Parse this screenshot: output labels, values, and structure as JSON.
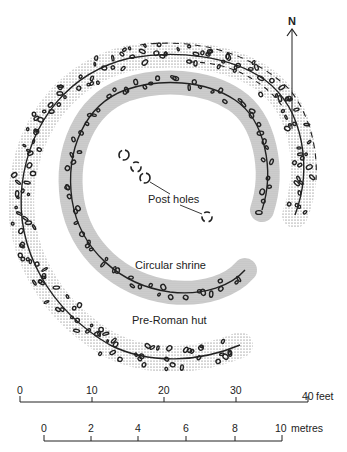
{
  "diagram": {
    "type": "archaeological site plan",
    "north_label": "N",
    "labels": {
      "post_holes": "Post holes",
      "circular_shrine": "Circular shrine",
      "pre_roman_hut": "Pre-Roman hut"
    },
    "scale_feet": {
      "ticks": [
        "0",
        "10",
        "20",
        "30",
        "40"
      ],
      "unit": "feet"
    },
    "scale_metres": {
      "ticks": [
        "0",
        "2",
        "4",
        "6",
        "8",
        "10"
      ],
      "unit": "metres"
    },
    "colors": {
      "ink": "#222222",
      "shrine_fill": "#c8c8c8",
      "background": "#ffffff"
    }
  }
}
